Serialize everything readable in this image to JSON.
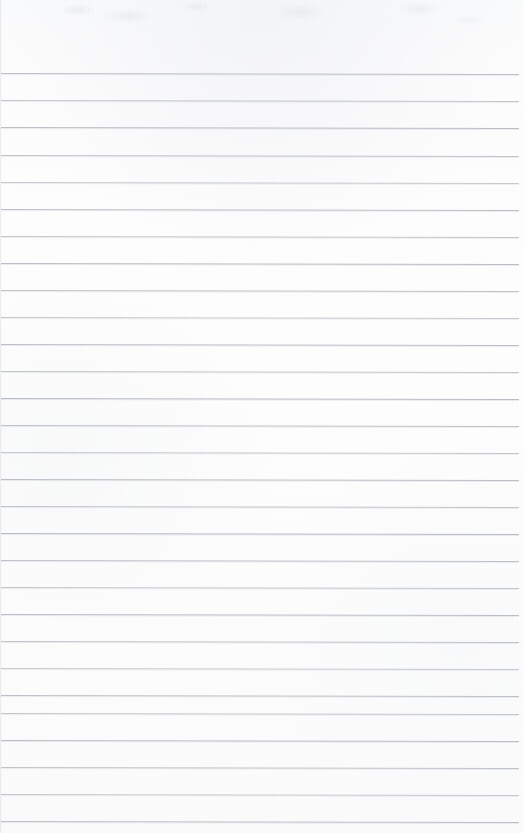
{
  "document": {
    "kind": "scanned-blank-ruled-page",
    "page_width": 524,
    "page_height": 833,
    "paper_color": "#fdfdfe",
    "rule_color": "#b9bdc5",
    "header_blank_height": 73,
    "text_content": "",
    "visible_text_blocks": [],
    "handwriting_present": false
  },
  "ruling": {
    "line_count": 28,
    "spacing_px": 27,
    "first_line_y": 73,
    "last_line_y": 821,
    "line_left_x": 1,
    "line_right_x": 519,
    "line_thickness_px": 1,
    "skew_deg": 0.12,
    "lines": [
      {
        "index": 1,
        "y": 73,
        "x1": 1,
        "x2": 519
      },
      {
        "index": 2,
        "y": 100,
        "x1": 1,
        "x2": 519
      },
      {
        "index": 3,
        "y": 127,
        "x1": 1,
        "x2": 519
      },
      {
        "index": 4,
        "y": 155,
        "x1": 1,
        "x2": 519
      },
      {
        "index": 5,
        "y": 182,
        "x1": 1,
        "x2": 519
      },
      {
        "index": 6,
        "y": 209,
        "x1": 1,
        "x2": 519
      },
      {
        "index": 7,
        "y": 236,
        "x1": 1,
        "x2": 519
      },
      {
        "index": 8,
        "y": 263,
        "x1": 1,
        "x2": 519
      },
      {
        "index": 9,
        "y": 290,
        "x1": 1,
        "x2": 519
      },
      {
        "index": 10,
        "y": 317,
        "x1": 1,
        "x2": 519
      },
      {
        "index": 11,
        "y": 344,
        "x1": 1,
        "x2": 519
      },
      {
        "index": 12,
        "y": 371,
        "x1": 1,
        "x2": 519
      },
      {
        "index": 13,
        "y": 398,
        "x1": 1,
        "x2": 519
      },
      {
        "index": 14,
        "y": 425,
        "x1": 1,
        "x2": 519
      },
      {
        "index": 15,
        "y": 452,
        "x1": 1,
        "x2": 519
      },
      {
        "index": 16,
        "y": 479,
        "x1": 1,
        "x2": 519
      },
      {
        "index": 17,
        "y": 506,
        "x1": 1,
        "x2": 519
      },
      {
        "index": 18,
        "y": 533,
        "x1": 1,
        "x2": 519
      },
      {
        "index": 19,
        "y": 560,
        "x1": 1,
        "x2": 519
      },
      {
        "index": 20,
        "y": 587,
        "x1": 1,
        "x2": 519
      },
      {
        "index": 21,
        "y": 614,
        "x1": 1,
        "x2": 519
      },
      {
        "index": 22,
        "y": 641,
        "x1": 1,
        "x2": 519
      },
      {
        "index": 23,
        "y": 668,
        "x1": 1,
        "x2": 519
      },
      {
        "index": 24,
        "y": 695,
        "x1": 1,
        "x2": 519
      },
      {
        "index": 25,
        "y": 713,
        "x1": 1,
        "x2": 519
      },
      {
        "index": 26,
        "y": 740,
        "x1": 1,
        "x2": 519
      },
      {
        "index": 27,
        "y": 767,
        "x1": 1,
        "x2": 519
      },
      {
        "index": 28,
        "y": 794,
        "x1": 1,
        "x2": 519
      },
      {
        "index": 29,
        "y": 821,
        "x1": 1,
        "x2": 519
      }
    ]
  }
}
